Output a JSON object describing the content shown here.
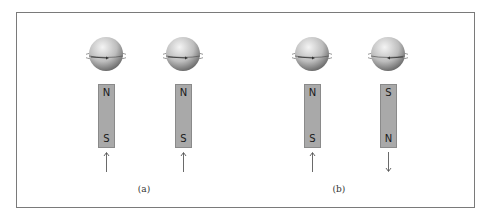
{
  "figure": {
    "panels": [
      {
        "label": "(a)",
        "items": [
          {
            "top_pole": "N",
            "bottom_pole": "S",
            "field_arrow": "up",
            "spin_arrow": "right"
          },
          {
            "top_pole": "N",
            "bottom_pole": "S",
            "field_arrow": "up",
            "spin_arrow": "right"
          }
        ]
      },
      {
        "label": "(b)",
        "items": [
          {
            "top_pole": "N",
            "bottom_pole": "S",
            "field_arrow": "up",
            "spin_arrow": "right"
          },
          {
            "top_pole": "S",
            "bottom_pole": "N",
            "field_arrow": "down",
            "spin_arrow": "left"
          }
        ]
      }
    ]
  },
  "colors": {
    "magnet": "#a9a9a9",
    "frame": "#7a7a7a",
    "orbit": "#555555"
  }
}
